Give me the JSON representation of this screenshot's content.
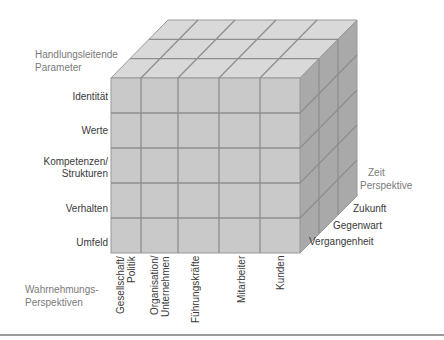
{
  "colors": {
    "top_face": "#d9d9d9",
    "front_face": "#c9c9c9",
    "right_face": "#a9a9a9",
    "grid_line": "#8e8e8e",
    "edge_line": "#999999",
    "axis_title": "#7a7a7a",
    "label_text": "#3a3a3a"
  },
  "axes": {
    "vertical_title_line1": "Handlungsleitende",
    "vertical_title_line2": "Parameter",
    "horizontal_title_line1": "Wahrnehmungs-",
    "horizontal_title_line2": "Perspektiven",
    "depth_title_line1": "Zeit",
    "depth_title_line2": "Perspektive"
  },
  "rows": [
    {
      "label": "Identität"
    },
    {
      "label": "Werte"
    },
    {
      "label_line1": "Kompetenzen/",
      "label_line2": "Strukturen"
    },
    {
      "label": "Verhalten"
    },
    {
      "label": "Umfeld"
    }
  ],
  "columns": [
    {
      "line1": "Gesellschaft/",
      "line2": "Politik"
    },
    {
      "line1": "Organisation/",
      "line2": "Unternehmen"
    },
    {
      "line1": "Führungskräfte"
    },
    {
      "line1": "Mitarbeiter"
    },
    {
      "line1": "Kunden"
    }
  ],
  "depth": [
    {
      "label": "Vergangenheit"
    },
    {
      "label": "Gegenwart"
    },
    {
      "label": "Zukunft"
    }
  ]
}
